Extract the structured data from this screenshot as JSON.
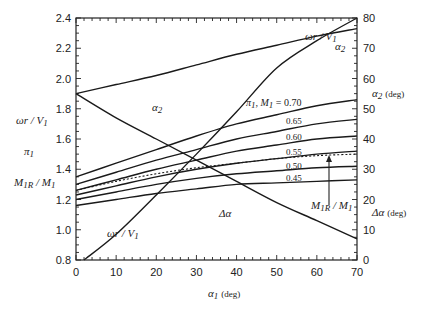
{
  "chart_data": {
    "type": "line",
    "title": "",
    "xlabel": "α1 (deg)",
    "ylabel_left": [
      "ωr / V1",
      "π1",
      "M1R / M1"
    ],
    "ylabel_right": [
      "α2 (deg)",
      "Δα (deg)"
    ],
    "xlim": [
      0,
      70
    ],
    "ylim_left": [
      0.8,
      2.4
    ],
    "ylim_right": [
      0,
      80
    ],
    "xticks": [
      "0",
      "10",
      "20",
      "30",
      "40",
      "50",
      "60",
      "70"
    ],
    "yticks_left": [
      "0.8",
      "1.0",
      "1.2",
      "1.4",
      "1.6",
      "1.8",
      "2.0",
      "2.2",
      "2.4"
    ],
    "yticks_right": [
      "0",
      "10",
      "20",
      "30",
      "40",
      "50",
      "60",
      "70",
      "80"
    ],
    "grid": false,
    "x": [
      0,
      10,
      20,
      30,
      40,
      50,
      60,
      70
    ],
    "series": [
      {
        "name": "π1, M1 = 0.70",
        "axis": "left",
        "values": [
          1.35,
          1.44,
          1.53,
          1.62,
          1.7,
          1.76,
          1.82,
          1.86
        ]
      },
      {
        "name": "0.65",
        "axis": "left",
        "values": [
          1.3,
          1.38,
          1.46,
          1.53,
          1.6,
          1.65,
          1.7,
          1.73
        ]
      },
      {
        "name": "0.60",
        "axis": "left",
        "values": [
          1.26,
          1.33,
          1.4,
          1.46,
          1.52,
          1.56,
          1.6,
          1.62
        ]
      },
      {
        "name": "0.55",
        "axis": "left",
        "values": [
          1.23,
          1.29,
          1.35,
          1.4,
          1.44,
          1.47,
          1.5,
          1.52
        ]
      },
      {
        "name": "0.50",
        "axis": "left",
        "values": [
          1.2,
          1.25,
          1.3,
          1.34,
          1.37,
          1.39,
          1.41,
          1.42
        ]
      },
      {
        "name": "0.45",
        "axis": "left",
        "values": [
          1.16,
          1.2,
          1.24,
          1.27,
          1.3,
          1.31,
          1.32,
          1.33
        ]
      },
      {
        "name": "M1R / M1",
        "axis": "left",
        "style": "dashed",
        "values": [
          1.26,
          1.32,
          1.37,
          1.41,
          1.44,
          1.47,
          1.49,
          1.5
        ]
      },
      {
        "name": "ωr / V1",
        "axis": "left",
        "values": [
          null,
          0.97,
          1.23,
          1.5,
          1.78,
          2.07,
          2.25,
          2.4
        ]
      },
      {
        "name": "α2",
        "axis": "right",
        "values": [
          55,
          58,
          61,
          64.5,
          68,
          71,
          74,
          76.5
        ]
      },
      {
        "name": "Δα",
        "axis": "right",
        "values": [
          55,
          47,
          40,
          33,
          26,
          19,
          13,
          7
        ]
      }
    ],
    "annotations": [
      {
        "text": "ωr / V1",
        "near": "upper right"
      },
      {
        "text": "α2",
        "near": "upper right"
      },
      {
        "text": "α2",
        "near": "upper left"
      },
      {
        "text": "π1, M1 = 0.70",
        "near": "center"
      },
      {
        "text": "0.65"
      },
      {
        "text": "0.60"
      },
      {
        "text": "0.55"
      },
      {
        "text": "0.50"
      },
      {
        "text": "0.45"
      },
      {
        "text": "Δα",
        "near": "lower center"
      },
      {
        "text": "ωr / V1",
        "near": "lower left"
      },
      {
        "text": "M1R / M1",
        "near": "lower right",
        "arrow": true
      }
    ]
  },
  "labels": {
    "xlabel_main": "α",
    "xlabel_sub": "1",
    "xlabel_unit": "(deg)",
    "left_omega": "ωr / V",
    "left_omega_sub": "1",
    "left_pi": "π",
    "left_pi_sub": "1",
    "left_m": "M",
    "left_m_sub": "1R",
    "left_m2": " / M",
    "left_m2_sub": "1",
    "right_alpha2": "α",
    "right_alpha2_sub": "2",
    "right_alpha2_unit": "(deg)",
    "right_dalpha": "Δα",
    "right_dalpha_unit": "(deg)",
    "ann_omega_top": "ωr / V",
    "ann_omega_top_sub": "1",
    "ann_alpha2_right": "α",
    "ann_alpha2_right_sub": "2",
    "ann_alpha2_left": "α",
    "ann_alpha2_left_sub": "2",
    "ann_family": "π",
    "ann_family_sub1": "1",
    "ann_family_mid": ", M",
    "ann_family_sub2": "1",
    "ann_family_val": " = 0.70",
    "ann_065": "0.65",
    "ann_060": "0.60",
    "ann_055": "0.55",
    "ann_050": "0.50",
    "ann_045": "0.45",
    "ann_dalpha": "Δα",
    "ann_omega_bottom": "ωr / V",
    "ann_omega_bottom_sub": "1",
    "ann_m": "M",
    "ann_m_sub": "1R",
    "ann_m2": " / M",
    "ann_m2_sub": "1"
  }
}
